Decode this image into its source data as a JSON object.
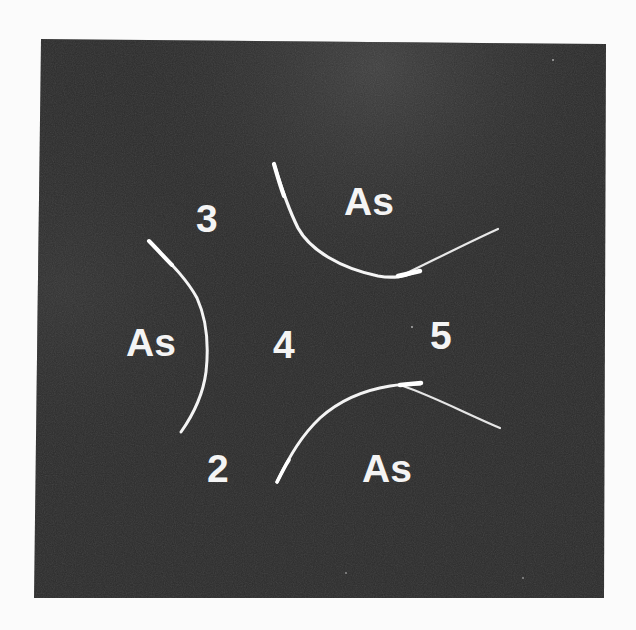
{
  "figure": {
    "colors": {
      "paper": "#fbfbfb",
      "photo_dark": "#2a2a2a",
      "photo_light_patch": "#3d3d3d",
      "streak": "#f2f2f2",
      "label": "#f4f4f4"
    },
    "labels": {
      "as_top": "As",
      "as_left": "As",
      "as_bottom": "As",
      "region_3": "3",
      "region_4": "4",
      "region_5": "5",
      "region_2": "2"
    }
  }
}
